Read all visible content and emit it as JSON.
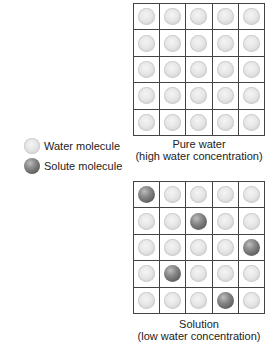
{
  "diagram": {
    "type": "osmosis-concentration-comparison",
    "legend": {
      "items": [
        {
          "label": "Water molecule",
          "kind": "water",
          "icon": "light-gray-sphere"
        },
        {
          "label": "Solute molecule",
          "kind": "solute",
          "icon": "dark-gray-sphere"
        }
      ]
    },
    "panels": [
      {
        "id": "pure-water",
        "title": "Pure water",
        "subtitle": "(high water concentration)",
        "rows": 5,
        "cols": 5,
        "cells": [
          [
            "water",
            "water",
            "water",
            "water",
            "water"
          ],
          [
            "water",
            "water",
            "water",
            "water",
            "water"
          ],
          [
            "water",
            "water",
            "water",
            "water",
            "water"
          ],
          [
            "water",
            "water",
            "water",
            "water",
            "water"
          ],
          [
            "water",
            "water",
            "water",
            "water",
            "water"
          ]
        ]
      },
      {
        "id": "solution",
        "title": "Solution",
        "subtitle": "(low water concentration)",
        "rows": 5,
        "cols": 5,
        "cells": [
          [
            "solute",
            "water",
            "water",
            "water",
            "water"
          ],
          [
            "water",
            "water",
            "solute",
            "water",
            "water"
          ],
          [
            "water",
            "water",
            "water",
            "water",
            "solute"
          ],
          [
            "water",
            "solute",
            "water",
            "water",
            "water"
          ],
          [
            "water",
            "water",
            "water",
            "solute",
            "water"
          ]
        ]
      }
    ],
    "colors": {
      "water": "#e6e6e6",
      "solute": "#6e6e6e",
      "grid_line": "#444444"
    }
  }
}
